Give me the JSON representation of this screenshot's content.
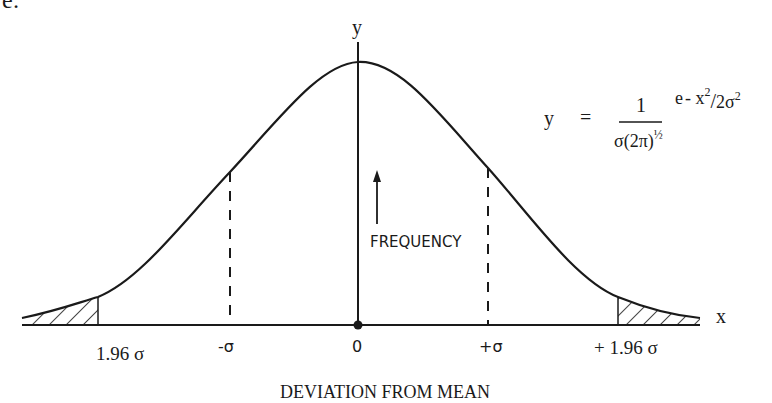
{
  "figure": {
    "type": "normal-distribution-curve",
    "top_left_fragment": "e:",
    "axes": {
      "y_label": "y",
      "x_label": "x"
    },
    "arrow_label": "FREQUENCY",
    "formula": {
      "lhs": "y",
      "equals": "=",
      "numerator": "1",
      "denominator_main": "σ(2π)",
      "denominator_exp": "½",
      "exp_base": "e",
      "exp_num": "- x",
      "exp_num_sup": "2",
      "exp_slash": "/",
      "exp_den": "2σ",
      "exp_den_sup": "2"
    },
    "ticks": {
      "left_196": "1.96 σ",
      "minus_sigma": "-σ",
      "zero": "0",
      "plus_sigma": "+σ",
      "right_196": "+ 1.96 σ"
    },
    "x_title": "DEVIATION FROM MEAN",
    "shaded_regions": [
      "x < -1.96σ",
      "x > +1.96σ"
    ],
    "dashed_markers": [
      "-σ",
      "+σ"
    ],
    "colors": {
      "ink": "#1a1a1a",
      "background": "#ffffff"
    }
  }
}
